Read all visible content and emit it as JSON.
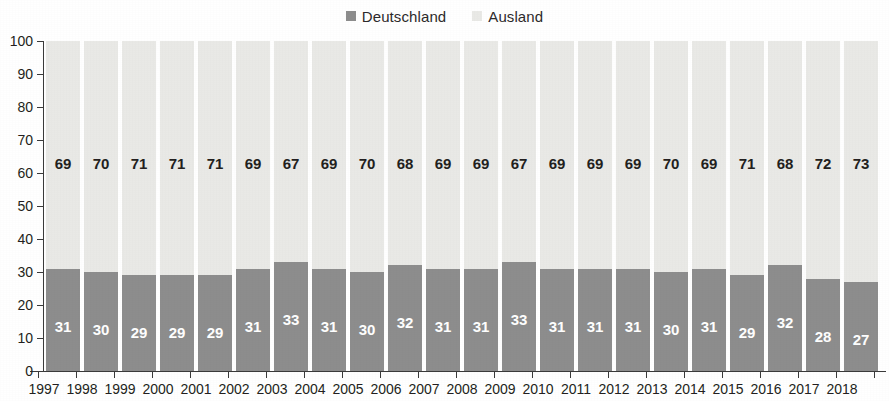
{
  "colors": {
    "deutschland": "#8d8d8d",
    "ausland": "#e9e9e6",
    "axis": "#3a3a3a",
    "text": "#231f20",
    "background": "#ffffff"
  },
  "legend": {
    "position": "top-center",
    "entries": [
      {
        "label": "Deutschland",
        "color": "#8d8d8d"
      },
      {
        "label": "Ausland",
        "color": "#e9e9e6"
      }
    ]
  },
  "chart_data": {
    "type": "bar",
    "stacked": true,
    "normalized_percent": true,
    "title": "",
    "subtitle": "",
    "xlabel": "",
    "ylabel": "",
    "ylim": [
      0,
      100
    ],
    "ytick_labels": [
      "0",
      "10",
      "20",
      "30",
      "40",
      "50",
      "60",
      "70",
      "80",
      "90",
      "100"
    ],
    "yticks": [
      0,
      10,
      20,
      30,
      40,
      50,
      60,
      70,
      80,
      90,
      100
    ],
    "grid": false,
    "legend_position": "top-center",
    "categories": [
      "1997",
      "1998",
      "1999",
      "2000",
      "2001",
      "2002",
      "2003",
      "2004",
      "2005",
      "2006",
      "2007",
      "2008",
      "2009",
      "2010",
      "2011",
      "2012",
      "2013",
      "2014",
      "2015",
      "2016",
      "2017",
      "2018"
    ],
    "series": [
      {
        "name": "Deutschland",
        "color": "#8d8d8d",
        "values": [
          31,
          30,
          29,
          29,
          29,
          31,
          33,
          31,
          30,
          32,
          31,
          31,
          33,
          31,
          31,
          31,
          30,
          31,
          29,
          32,
          28,
          27
        ]
      },
      {
        "name": "Ausland",
        "color": "#e9e9e6",
        "values": [
          69,
          70,
          71,
          71,
          71,
          69,
          67,
          69,
          70,
          68,
          69,
          69,
          67,
          69,
          69,
          69,
          70,
          69,
          71,
          68,
          72,
          73
        ]
      }
    ]
  }
}
